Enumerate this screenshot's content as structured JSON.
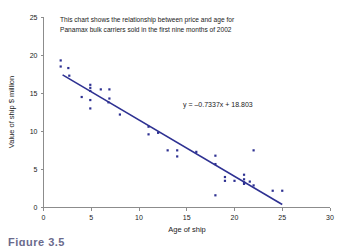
{
  "figure": {
    "caption": "Figure 3.5"
  },
  "chart_data": {
    "type": "scatter",
    "title": "",
    "annotation": "This chart shows the relationship between price and age for Panamax bulk carriers sold in the first nine months of 2002",
    "annotation_line1": "This chart shows the relationship between price and age for",
    "annotation_line2": "Panamax bulk carriers sold in the first nine months of 2002",
    "equation": "y = –0.7337x + 18.803",
    "slope": -0.7337,
    "intercept": 18.803,
    "xlabel": "Age of ship",
    "ylabel": "Value of ship $ million",
    "xlim": [
      0,
      30
    ],
    "ylim": [
      0,
      25
    ],
    "xticks": [
      0,
      5,
      10,
      15,
      20,
      25,
      30
    ],
    "yticks": [
      0,
      5,
      10,
      15,
      20,
      25
    ],
    "grid": false,
    "legend": "none",
    "series_color": "#2e3192",
    "trendline": {
      "x_start": 2.0,
      "y_start": 17.4,
      "x_end": 25.0,
      "y_end": 0.4,
      "color": "#2e3192"
    },
    "points": [
      [
        1.8,
        19.3
      ],
      [
        1.8,
        18.5
      ],
      [
        2.6,
        18.3
      ],
      [
        2.7,
        17.3
      ],
      [
        4.0,
        14.5
      ],
      [
        4.9,
        16.1
      ],
      [
        4.9,
        15.7
      ],
      [
        4.9,
        15.3
      ],
      [
        4.9,
        14.1
      ],
      [
        4.9,
        13.0
      ],
      [
        6.0,
        15.5
      ],
      [
        6.9,
        15.5
      ],
      [
        6.9,
        14.3
      ],
      [
        6.8,
        13.8
      ],
      [
        8.0,
        12.2
      ],
      [
        11.0,
        10.6
      ],
      [
        11.0,
        9.6
      ],
      [
        12.0,
        9.8
      ],
      [
        13.0,
        7.5
      ],
      [
        14.0,
        7.5
      ],
      [
        14.0,
        6.7
      ],
      [
        16.0,
        7.3
      ],
      [
        18.0,
        6.8
      ],
      [
        18.0,
        5.7
      ],
      [
        18.0,
        1.6
      ],
      [
        19.0,
        4.0
      ],
      [
        19.0,
        3.5
      ],
      [
        20.0,
        3.5
      ],
      [
        21.0,
        4.3
      ],
      [
        21.0,
        3.7
      ],
      [
        21.0,
        3.3
      ],
      [
        21.0,
        3.1
      ],
      [
        21.6,
        3.4
      ],
      [
        22.0,
        7.5
      ],
      [
        22.0,
        2.9
      ],
      [
        24.0,
        2.2
      ],
      [
        25.0,
        2.2
      ]
    ]
  }
}
